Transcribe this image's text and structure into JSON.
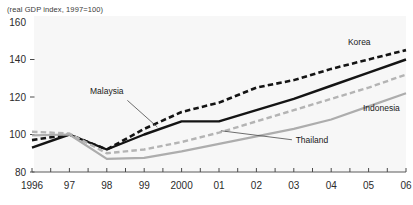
{
  "chart_data": {
    "type": "line",
    "title": "",
    "subtitle": "(real GDP index, 1997=100)",
    "xlabel": "",
    "ylabel": "",
    "x": [
      1996,
      1997,
      1998,
      1999,
      2000,
      2001,
      2002,
      2003,
      2004,
      2005,
      2006
    ],
    "xtick_labels": [
      "1996",
      "97",
      "98",
      "99",
      "2000",
      "01",
      "02",
      "03",
      "04",
      "05",
      "06"
    ],
    "ytick_labels": [
      "160",
      "140",
      "120",
      "100",
      "80"
    ],
    "yticks": [
      160,
      140,
      120,
      100,
      80
    ],
    "ylim": [
      80,
      160
    ],
    "xlim": [
      1996,
      2006
    ],
    "grid": false,
    "legend_position": "inline-annotations",
    "series": [
      {
        "name": "Korea",
        "values": [
          97,
          100,
          92,
          103,
          112,
          117,
          125,
          129,
          135,
          140,
          145
        ],
        "color": "#141414",
        "style": "dashed",
        "width": 2.6
      },
      {
        "name": "Malaysia",
        "values": [
          93,
          100,
          92,
          100,
          107,
          107,
          113,
          119,
          126,
          133,
          140
        ],
        "color": "#141414",
        "style": "solid",
        "width": 2.4
      },
      {
        "name": "Thailand",
        "values": [
          101.5,
          100.5,
          90,
          92,
          96,
          101,
          107,
          113,
          119,
          125,
          132
        ],
        "color": "#b4b4b4",
        "style": "dashed",
        "width": 2.4
      },
      {
        "name": "Indonesia",
        "values": [
          99.5,
          100,
          87,
          87.5,
          91,
          95,
          99,
          103,
          108,
          115,
          122
        ],
        "color": "#adadad",
        "style": "solid",
        "width": 2.2
      }
    ],
    "annotations": [
      {
        "text": "Malaysia",
        "label_x": 1998.0,
        "label_y": 121.5,
        "anchor": "middle",
        "leader_from": [
          1998.55,
          118.2
        ],
        "leader_to": [
          1999.35,
          104.0
        ]
      },
      {
        "text": "Thailand",
        "label_x": 2003.05,
        "label_y": 95.5,
        "anchor": "start",
        "leader_from": [
          2002.95,
          97.2
        ],
        "leader_to": [
          2001.05,
          102.0
        ]
      },
      {
        "text": "Korea",
        "label_x": 2004.75,
        "label_y": 148.0,
        "anchor": "middle",
        "leader_from": null,
        "leader_to": null
      },
      {
        "text": "Indonesia",
        "label_x": 2004.85,
        "label_y": 112.5,
        "anchor": "start",
        "leader_from": null,
        "leader_to": null
      }
    ],
    "colors": {
      "korea": "#141414",
      "malaysia": "#141414",
      "thailand": "#b4b4b4",
      "indonesia": "#adadad",
      "axis": "#4a4a4a",
      "text": "#2b2b2b",
      "plot_background": "#f7f7f7"
    }
  }
}
